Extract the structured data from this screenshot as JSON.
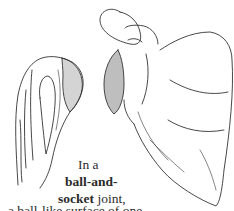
{
  "illustration": {
    "left_bone": "humerus-head (ball)",
    "right_bone": "scapula with glenoid socket"
  },
  "caption": {
    "line1": "In a",
    "line2_bold": "ball-and-",
    "line3_bold": "socket",
    "line3_rest": " joint,",
    "line4": "a ball-like surface of one"
  }
}
